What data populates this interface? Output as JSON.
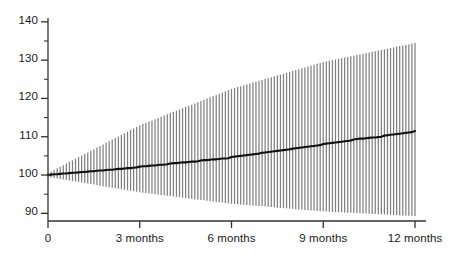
{
  "chart_data": {
    "type": "line",
    "title": "",
    "subtitle": "",
    "xlabel": "",
    "ylabel": "",
    "grid": false,
    "legend": "none",
    "xlim": [
      0,
      12
    ],
    "ylim": [
      88,
      141
    ],
    "y_axis": {
      "min": 90,
      "max": 140,
      "major_step": 10,
      "minor_step": 5,
      "tick_labels": [
        "90",
        "100",
        "110",
        "120",
        "130",
        "140"
      ],
      "tick_values": [
        90,
        100,
        110,
        120,
        130,
        140
      ],
      "minor_tick_values": [
        95,
        105,
        115,
        125,
        135
      ]
    },
    "x_axis": {
      "min": 0,
      "max": 12,
      "unit": "months",
      "tick_labels": [
        "0",
        "3 months",
        "6 months",
        "9 months",
        "12 months"
      ],
      "tick_values": [
        0,
        3,
        6,
        9,
        12
      ]
    },
    "series": [
      {
        "name": "mean",
        "style": "line",
        "color": "#111111",
        "x": [
          0,
          0.1,
          0.2,
          0.3,
          0.4,
          0.5,
          0.6,
          0.7,
          0.8,
          0.9,
          1,
          1.1,
          1.2,
          1.3,
          1.4,
          1.5,
          1.6,
          1.7,
          1.8,
          1.9,
          2,
          2.1,
          2.2,
          2.3,
          2.4,
          2.5,
          2.6,
          2.7,
          2.8,
          2.9,
          3,
          3.1,
          3.2,
          3.3,
          3.4,
          3.5,
          3.6,
          3.7,
          3.8,
          3.9,
          4,
          4.1,
          4.2,
          4.3,
          4.4,
          4.5,
          4.6,
          4.7,
          4.8,
          4.9,
          5,
          5.1,
          5.2,
          5.3,
          5.4,
          5.5,
          5.6,
          5.7,
          5.8,
          5.9,
          6,
          6.1,
          6.2,
          6.3,
          6.4,
          6.5,
          6.6,
          6.7,
          6.8,
          6.9,
          7,
          7.1,
          7.2,
          7.3,
          7.4,
          7.5,
          7.6,
          7.7,
          7.8,
          7.9,
          8,
          8.1,
          8.2,
          8.3,
          8.4,
          8.5,
          8.6,
          8.7,
          8.8,
          8.9,
          9,
          9.1,
          9.2,
          9.3,
          9.4,
          9.5,
          9.6,
          9.7,
          9.8,
          9.9,
          10,
          10.1,
          10.2,
          10.3,
          10.4,
          10.5,
          10.6,
          10.7,
          10.8,
          10.9,
          11,
          11.1,
          11.2,
          11.3,
          11.4,
          11.5,
          11.6,
          11.7,
          11.8,
          11.9,
          12
        ],
        "values": [
          100.0,
          100.1,
          100.2,
          100.2,
          100.3,
          100.4,
          100.4,
          100.5,
          100.6,
          100.6,
          100.7,
          100.8,
          100.8,
          100.9,
          101.0,
          101.0,
          101.1,
          101.2,
          101.2,
          101.3,
          101.4,
          101.4,
          101.5,
          101.6,
          101.6,
          101.7,
          101.8,
          101.8,
          101.9,
          102.0,
          102.2,
          102.3,
          102.3,
          102.4,
          102.5,
          102.5,
          102.6,
          102.7,
          102.7,
          102.8,
          103.0,
          103.1,
          103.1,
          103.2,
          103.3,
          103.3,
          103.4,
          103.5,
          103.5,
          103.6,
          103.8,
          103.9,
          103.9,
          104.0,
          104.1,
          104.1,
          104.2,
          104.3,
          104.3,
          104.4,
          104.7,
          104.8,
          104.9,
          105.0,
          105.1,
          105.2,
          105.3,
          105.4,
          105.5,
          105.6,
          105.8,
          105.9,
          106.0,
          106.1,
          106.2,
          106.3,
          106.4,
          106.5,
          106.6,
          106.7,
          106.9,
          107.0,
          107.1,
          107.2,
          107.3,
          107.4,
          107.5,
          107.6,
          107.7,
          107.8,
          108.1,
          108.2,
          108.3,
          108.4,
          108.5,
          108.6,
          108.7,
          108.8,
          108.9,
          109.0,
          109.3,
          109.4,
          109.5,
          109.5,
          109.6,
          109.7,
          109.8,
          109.8,
          109.9,
          110.0,
          110.3,
          110.4,
          110.5,
          110.6,
          110.7,
          110.8,
          110.9,
          111.0,
          111.1,
          111.2,
          111.5
        ]
      },
      {
        "name": "upper-confidence-bound",
        "style": "error-bar-top",
        "color": "#808080",
        "x": [
          0,
          3,
          6,
          9,
          12
        ],
        "values": [
          100.5,
          113.0,
          122.5,
          129.5,
          134.5
        ]
      },
      {
        "name": "lower-confidence-bound",
        "style": "error-bar-bottom",
        "color": "#808080",
        "x": [
          0,
          3,
          6,
          9,
          12
        ],
        "values": [
          99.5,
          95.5,
          92.5,
          90.5,
          89.3
        ]
      }
    ],
    "error_bars": {
      "count": 120,
      "spacing_months": 0.1,
      "color": "#808080",
      "description": "Vertical confidence-interval bars fanning out from the origin"
    },
    "annotations": []
  },
  "axes": {
    "y_labels": [
      "140",
      "130",
      "120",
      "110",
      "100",
      "90"
    ],
    "x_labels": [
      "0",
      "3 months",
      "6 months",
      "9 months",
      "12 months"
    ]
  },
  "colors": {
    "axis": "#333333",
    "mean_line": "#111111",
    "error_bar": "#808080",
    "background": "#ffffff",
    "text": "#1a1a1a"
  }
}
